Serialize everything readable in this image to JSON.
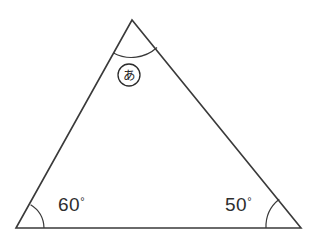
{
  "figure": {
    "background_color": "#ffffff",
    "stroke_color": "#3a3a3a",
    "text_color": "#2e2e2e"
  },
  "triangle": {
    "vertices": {
      "apex": {
        "label": "apex-vertex",
        "x": 132,
        "y": 20
      },
      "bottom_left": {
        "label": "bottom-left-vertex",
        "x": 16,
        "y": 228
      },
      "bottom_right": {
        "label": "bottom-right-vertex",
        "x": 301,
        "y": 228
      }
    },
    "edges": [
      {
        "name": "left-edge",
        "from": "bottom_left",
        "to": "apex"
      },
      {
        "name": "right-edge",
        "from": "apex",
        "to": "bottom_right"
      },
      {
        "name": "base-edge",
        "from": "bottom_left",
        "to": "bottom_right"
      }
    ]
  },
  "angles": {
    "apex": {
      "name": "unknown-angle",
      "value_label": "あ",
      "marker_style": "circled-hiragana",
      "arc_radius": 35,
      "arc_path": "M 112.5 48.7 A 35 35 0 0 0 158.0 43.1"
    },
    "bottom_left": {
      "name": "left-base-angle",
      "number": "60",
      "degree_symbol": "°",
      "full_label": "60°",
      "arc_radius": 28,
      "arc_path": "M 44 228 A 28 28 0 0 0 31.5 204.6",
      "text_x": 58,
      "text_y": 211
    },
    "bottom_right": {
      "name": "right-base-angle",
      "number": "50",
      "degree_symbol": "°",
      "full_label": "50°",
      "arc_radius": 35,
      "arc_path": "M 266 228 A 35 35 0 0 1 278.5 199.0",
      "text_x": 225,
      "text_y": 211
    }
  },
  "marker": {
    "name": "circled-label-a",
    "character": "あ",
    "center_x": 129,
    "center_y": 75,
    "radius": 11
  }
}
